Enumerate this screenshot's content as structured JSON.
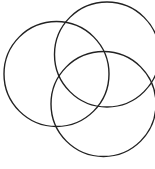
{
  "diagram": {
    "type": "venn",
    "background": "#ffffff",
    "stroke_color": "#222222",
    "stroke_width": 1.4,
    "circles": [
      {
        "name": "left-circle",
        "cx": 56.5,
        "cy": 74,
        "r": 52.5
      },
      {
        "name": "top-right-circle",
        "cx": 107,
        "cy": 54.5,
        "r": 52.5
      },
      {
        "name": "bottom-circle",
        "cx": 103.5,
        "cy": 104,
        "r": 52.5
      }
    ]
  }
}
